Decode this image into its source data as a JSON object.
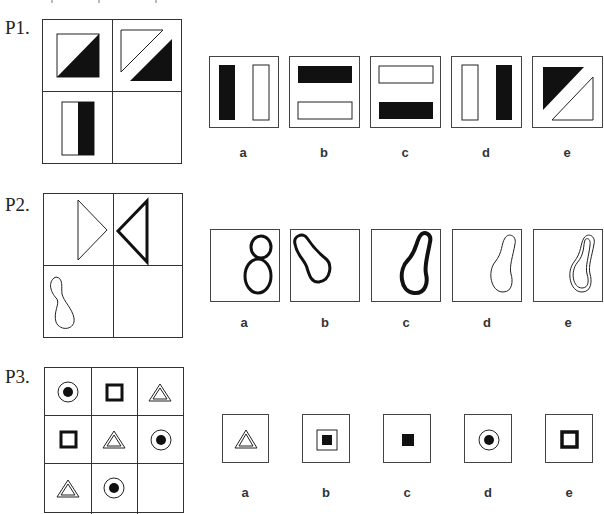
{
  "problems": [
    {
      "label": "P1.",
      "grid": {
        "rows": 2,
        "cols": 2,
        "cells": [
          "square-with-black-lower-right-triangle",
          "split-diagonal-white-upper-black-lower",
          "rectangle-white-left-black-right",
          "empty"
        ]
      },
      "options": [
        {
          "label": "a",
          "figure": "black-left-bar-white-right-bar"
        },
        {
          "label": "b",
          "figure": "black-top-bar-white-bottom-bar"
        },
        {
          "label": "c",
          "figure": "white-top-bar-black-bottom-bar"
        },
        {
          "label": "d",
          "figure": "white-left-bar-black-right-bar"
        },
        {
          "label": "e",
          "figure": "split-diagonal-black-upper-white-lower"
        }
      ]
    },
    {
      "label": "P2.",
      "grid": {
        "rows": 2,
        "cols": 2,
        "cells": [
          "thin-triangle-pointing-right",
          "thick-triangle-pointing-left",
          "thin-peanut-shape",
          "empty"
        ]
      },
      "options": [
        {
          "label": "a",
          "figure": "thick-figure-eight"
        },
        {
          "label": "b",
          "figure": "thick-peanut-tilted-left"
        },
        {
          "label": "c",
          "figure": "thick-peanut-tilted-right"
        },
        {
          "label": "d",
          "figure": "thin-peanut-tilted-right"
        },
        {
          "label": "e",
          "figure": "double-line-peanut"
        }
      ]
    },
    {
      "label": "P3.",
      "grid": {
        "rows": 3,
        "cols": 3,
        "cells": [
          "circle-dot",
          "thick-square",
          "double-triangle",
          "thick-square",
          "double-triangle",
          "circle-dot",
          "double-triangle",
          "circle-dot",
          "empty"
        ]
      },
      "options": [
        {
          "label": "a",
          "figure": "double-triangle"
        },
        {
          "label": "b",
          "figure": "square-in-square-black"
        },
        {
          "label": "c",
          "figure": "small-black-square"
        },
        {
          "label": "d",
          "figure": "circle-dot"
        },
        {
          "label": "e",
          "figure": "thick-square"
        }
      ]
    }
  ],
  "colors": {
    "stroke": "#222222",
    "fill_black": "#111111",
    "background": "#ffffff"
  }
}
